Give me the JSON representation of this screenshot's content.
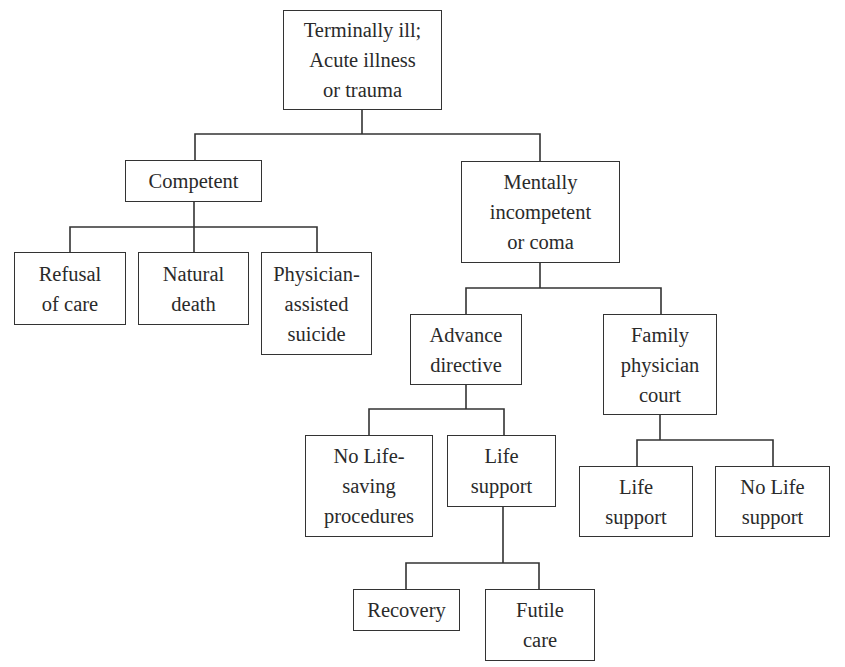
{
  "diagram": {
    "type": "tree",
    "nodes": {
      "root": {
        "lines": [
          "Terminally ill;",
          "Acute illness",
          "or trauma"
        ]
      },
      "competent": {
        "lines": [
          "Competent"
        ]
      },
      "incompetent": {
        "lines": [
          "Mentally",
          "incompetent",
          "or coma"
        ]
      },
      "refusal": {
        "lines": [
          "Refusal",
          "of care"
        ]
      },
      "natural": {
        "lines": [
          "Natural",
          "death"
        ]
      },
      "pas": {
        "lines": [
          "Physician-",
          "assisted",
          "suicide"
        ]
      },
      "advance": {
        "lines": [
          "Advance",
          "directive"
        ]
      },
      "family": {
        "lines": [
          "Family",
          "physician",
          "court"
        ]
      },
      "nolifesaving": {
        "lines": [
          "No Life-",
          "saving",
          "procedures"
        ]
      },
      "lifesupport_a": {
        "lines": [
          "Life",
          "support"
        ]
      },
      "lifesupport_b": {
        "lines": [
          "Life",
          "support"
        ]
      },
      "nolifesupport": {
        "lines": [
          "No Life",
          "support"
        ]
      },
      "recovery": {
        "lines": [
          "Recovery"
        ]
      },
      "futile": {
        "lines": [
          "Futile",
          "care"
        ]
      }
    },
    "edges": [
      [
        "root",
        "competent"
      ],
      [
        "root",
        "incompetent"
      ],
      [
        "competent",
        "refusal"
      ],
      [
        "competent",
        "natural"
      ],
      [
        "competent",
        "pas"
      ],
      [
        "incompetent",
        "advance"
      ],
      [
        "incompetent",
        "family"
      ],
      [
        "advance",
        "nolifesaving"
      ],
      [
        "advance",
        "lifesupport_a"
      ],
      [
        "family",
        "lifesupport_b"
      ],
      [
        "family",
        "nolifesupport"
      ],
      [
        "lifesupport_a",
        "recovery"
      ],
      [
        "lifesupport_a",
        "futile"
      ]
    ]
  }
}
